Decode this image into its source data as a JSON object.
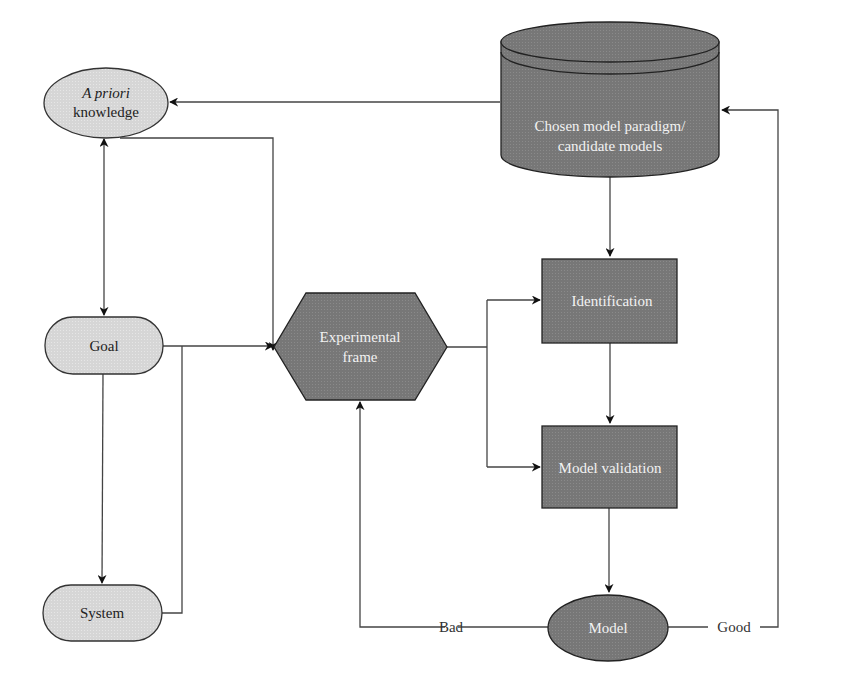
{
  "colors": {
    "light_fill": "#d9d9d9",
    "dark_fill": "#7a7a7a",
    "stroke": "#333333",
    "line": "#555555",
    "dark_text": "#f2f2f2",
    "light_text": "#222222"
  },
  "nodes": {
    "a_priori": {
      "line1": "A priori",
      "line2": "knowledge",
      "shape": "ellipse"
    },
    "database": {
      "line1": "Chosen model paradigm/",
      "line2": "candidate models",
      "shape": "cylinder"
    },
    "goal": {
      "label": "Goal",
      "shape": "rounded-rect"
    },
    "system": {
      "label": "System",
      "shape": "rounded-rect"
    },
    "experimental_frame": {
      "line1": "Experimental",
      "line2": "frame",
      "shape": "hexagon"
    },
    "identification": {
      "label": "Identification",
      "shape": "rect"
    },
    "model_validation": {
      "label": "Model validation",
      "shape": "rect"
    },
    "model": {
      "label": "Model",
      "shape": "ellipse"
    }
  },
  "edges": {
    "bad": "Bad",
    "good": "Good"
  },
  "connections": [
    {
      "from": "database",
      "to": "a_priori"
    },
    {
      "from": "a_priori",
      "to": "goal",
      "bidirectional": true
    },
    {
      "from": "a_priori",
      "to": "experimental_frame"
    },
    {
      "from": "goal",
      "to": "experimental_frame"
    },
    {
      "from": "goal",
      "to": "system"
    },
    {
      "from": "system",
      "to": "experimental_frame"
    },
    {
      "from": "experimental_frame",
      "to": "identification"
    },
    {
      "from": "experimental_frame",
      "to": "model_validation"
    },
    {
      "from": "database",
      "to": "identification"
    },
    {
      "from": "identification",
      "to": "model_validation"
    },
    {
      "from": "model_validation",
      "to": "model"
    },
    {
      "from": "model",
      "to": "experimental_frame",
      "label": "Bad"
    },
    {
      "from": "model",
      "to": "database",
      "label": "Good"
    }
  ]
}
